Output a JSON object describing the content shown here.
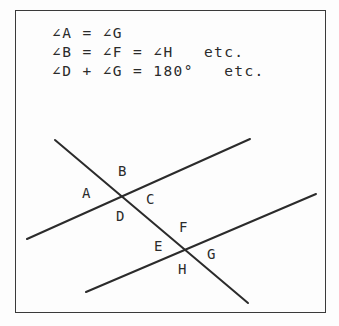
{
  "figure": {
    "background_color": "#fdfdfd",
    "ink_color": "#2b2b2b",
    "frame": {
      "name": "diagram-border",
      "x": 15,
      "y": 10,
      "width": 311,
      "height": 303,
      "stroke_color": "#3a3a3a",
      "stroke_width": 1.5
    }
  },
  "equations": {
    "lines": [
      "∠A = ∠G",
      "∠B = ∠F = ∠H   etc.",
      "∠D + ∠G = 180°   etc."
    ]
  },
  "chart_data": {
    "type": "diagram",
    "title": "",
    "lines": [
      {
        "name": "transversal",
        "role": "transversal",
        "x1": 55,
        "y1": 140,
        "x2": 248,
        "y2": 303,
        "stroke_width": 2.0
      },
      {
        "name": "parallel-line-upper",
        "role": "parallel",
        "x1": 27,
        "y1": 239,
        "x2": 250,
        "y2": 139,
        "stroke_width": 2.0
      },
      {
        "name": "parallel-line-lower",
        "role": "parallel",
        "x1": 86,
        "y1": 292,
        "x2": 316,
        "y2": 194,
        "stroke_width": 2.0
      }
    ],
    "intersections": [
      {
        "name": "upper-intersection",
        "x": 124,
        "y": 197,
        "angles": [
          "A",
          "B",
          "C",
          "D"
        ]
      },
      {
        "name": "lower-intersection",
        "x": 186,
        "y": 250,
        "angles": [
          "E",
          "F",
          "G",
          "H"
        ]
      }
    ],
    "angle_labels": [
      {
        "label": "A",
        "x": 82,
        "y": 186,
        "at": "upper-intersection",
        "position": "left"
      },
      {
        "label": "B",
        "x": 118,
        "y": 164,
        "at": "upper-intersection",
        "position": "top"
      },
      {
        "label": "C",
        "x": 146,
        "y": 192,
        "at": "upper-intersection",
        "position": "right"
      },
      {
        "label": "D",
        "x": 116,
        "y": 209,
        "at": "upper-intersection",
        "position": "bottom"
      },
      {
        "label": "E",
        "x": 154,
        "y": 239,
        "at": "lower-intersection",
        "position": "left"
      },
      {
        "label": "F",
        "x": 179,
        "y": 220,
        "at": "lower-intersection",
        "position": "top"
      },
      {
        "label": "G",
        "x": 207,
        "y": 247,
        "at": "lower-intersection",
        "position": "right"
      },
      {
        "label": "H",
        "x": 178,
        "y": 262,
        "at": "lower-intersection",
        "position": "bottom"
      }
    ],
    "relations": [
      "∠A = ∠G",
      "∠B = ∠F = ∠H",
      "∠D + ∠G = 180°"
    ]
  }
}
